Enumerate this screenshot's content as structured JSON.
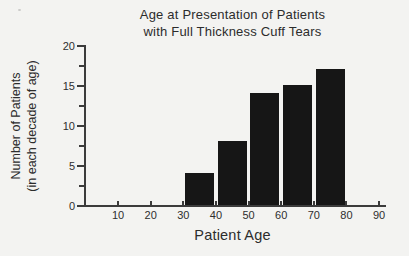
{
  "figure": {
    "title_line1": "Age at Presentation of Patients",
    "title_line2": "with Full Thickness Cuff Tears"
  },
  "chart_data": {
    "type": "bar",
    "title": "Age at Presentation of Patients with Full Thickness Cuff Tears",
    "xlabel": "Patient Age",
    "ylabel": "Number of Patients (in each decade of age)",
    "ylabel_line1": "Number of Patients",
    "ylabel_line2": "(in each decade of age)",
    "categories": [
      "30-40",
      "40-50",
      "50-60",
      "60-70",
      "70-80"
    ],
    "values": [
      4,
      8,
      14,
      15,
      17
    ],
    "bars": [
      {
        "decade_start": 30,
        "decade_end": 40,
        "value": 4
      },
      {
        "decade_start": 40,
        "decade_end": 50,
        "value": 8
      },
      {
        "decade_start": 50,
        "decade_end": 60,
        "value": 14
      },
      {
        "decade_start": 60,
        "decade_end": 70,
        "value": 15
      },
      {
        "decade_start": 70,
        "decade_end": 80,
        "value": 17
      }
    ],
    "x_ticks": [
      10,
      20,
      30,
      40,
      50,
      60,
      70,
      80,
      90
    ],
    "y_ticks": [
      0,
      5,
      10,
      15,
      20
    ],
    "y_minor_ticks": [
      2.5,
      7.5,
      12.5,
      17.5
    ],
    "xlim": [
      0,
      92
    ],
    "ylim": [
      0,
      20
    ],
    "grid": false,
    "legend": null,
    "bar_color": "#161616",
    "axis_color": "#3b3b3b",
    "background_color": "#f3f3f1"
  }
}
